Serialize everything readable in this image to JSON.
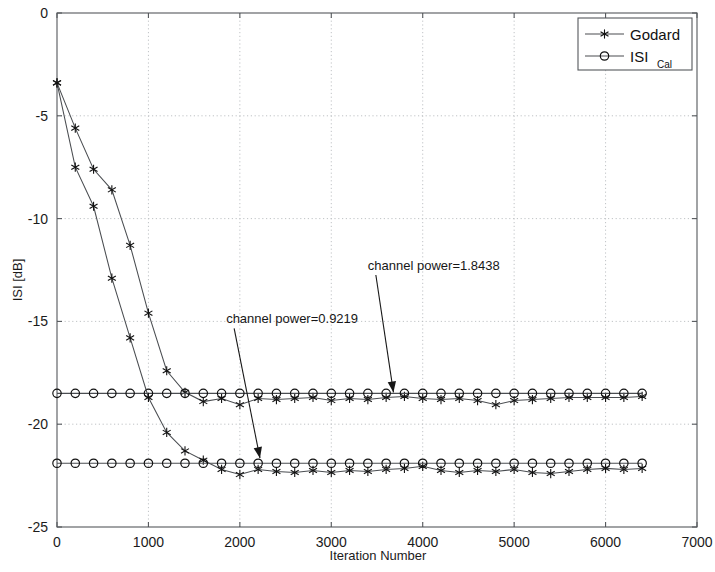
{
  "chart_data": {
    "type": "line",
    "title": "",
    "xlabel": "Iteration Number",
    "ylabel": "ISI [dB]",
    "xlim": [
      0,
      7000
    ],
    "ylim": [
      -25,
      0
    ],
    "xticks": [
      0,
      1000,
      2000,
      3000,
      4000,
      5000,
      6000,
      7000
    ],
    "yticks": [
      0,
      -5,
      -10,
      -15,
      -20,
      -25
    ],
    "xtick_labels": [
      "0",
      "1000",
      "2000",
      "3000",
      "4000",
      "5000",
      "6000",
      "7000"
    ],
    "ytick_labels": [
      "0",
      "-5",
      "-10",
      "-15",
      "-20",
      "-25"
    ],
    "grid": true,
    "legend_position": "top-right",
    "legend": [
      "Godard",
      "ISI Cal"
    ],
    "marker_interval": 200,
    "annotations": [
      {
        "text": "channel power=1.8438",
        "text_x": 3400,
        "text_y": -12.5,
        "target_x": 3680,
        "target_y": -18.6
      },
      {
        "text": "channel power=0.9219",
        "text_x": 1850,
        "text_y": -15.1,
        "target_x": 2220,
        "target_y": -21.8
      }
    ],
    "series": [
      {
        "name": "Godard-upper",
        "legend_ref": "Godard",
        "marker": "asterisk",
        "x": [
          0,
          200,
          400,
          600,
          800,
          1000,
          1200,
          1400,
          1600,
          1800,
          2000,
          2200,
          2400,
          2600,
          2800,
          3000,
          3200,
          3400,
          3600,
          3800,
          4000,
          4200,
          4400,
          4600,
          4800,
          5000,
          5200,
          5400,
          5600,
          5800,
          6000,
          6200,
          6400
        ],
        "y": [
          -3.4,
          -5.6,
          -7.6,
          -8.6,
          -11.3,
          -14.6,
          -17.4,
          -18.45,
          -18.9,
          -18.75,
          -19.05,
          -18.75,
          -18.8,
          -18.75,
          -18.7,
          -18.85,
          -18.75,
          -18.8,
          -18.7,
          -18.65,
          -18.75,
          -18.8,
          -18.75,
          -18.85,
          -19.05,
          -18.85,
          -18.8,
          -18.75,
          -18.7,
          -18.7,
          -18.7,
          -18.7,
          -18.65
        ]
      },
      {
        "name": "ISI-Cal-upper",
        "legend_ref": "ISI Cal",
        "marker": "circle",
        "x": [
          0,
          200,
          400,
          600,
          800,
          1000,
          1200,
          1400,
          1600,
          1800,
          2000,
          2200,
          2400,
          2600,
          2800,
          3000,
          3200,
          3400,
          3600,
          3800,
          4000,
          4200,
          4400,
          4600,
          4800,
          5000,
          5200,
          5400,
          5600,
          5800,
          6000,
          6200,
          6400
        ],
        "y": [
          -18.5,
          -18.5,
          -18.5,
          -18.5,
          -18.5,
          -18.5,
          -18.5,
          -18.5,
          -18.5,
          -18.5,
          -18.5,
          -18.5,
          -18.5,
          -18.5,
          -18.5,
          -18.5,
          -18.5,
          -18.5,
          -18.5,
          -18.5,
          -18.5,
          -18.5,
          -18.5,
          -18.5,
          -18.5,
          -18.5,
          -18.5,
          -18.5,
          -18.5,
          -18.5,
          -18.5,
          -18.5,
          -18.5
        ]
      },
      {
        "name": "Godard-lower",
        "legend_ref": "Godard",
        "marker": "asterisk",
        "x": [
          0,
          200,
          400,
          600,
          800,
          1000,
          1200,
          1400,
          1600,
          1800,
          2000,
          2200,
          2400,
          2600,
          2800,
          3000,
          3200,
          3400,
          3600,
          3800,
          4000,
          4200,
          4400,
          4600,
          4800,
          5000,
          5200,
          5400,
          5600,
          5800,
          6000,
          6200,
          6400
        ],
        "y": [
          -3.4,
          -7.5,
          -9.4,
          -12.9,
          -15.8,
          -18.7,
          -20.4,
          -21.3,
          -21.75,
          -22.2,
          -22.45,
          -22.2,
          -22.3,
          -22.35,
          -22.25,
          -22.35,
          -22.25,
          -22.3,
          -22.2,
          -22.15,
          -22.05,
          -22.25,
          -22.35,
          -22.25,
          -22.3,
          -22.2,
          -22.35,
          -22.4,
          -22.3,
          -22.2,
          -22.15,
          -22.2,
          -22.15
        ]
      },
      {
        "name": "ISI-Cal-lower",
        "legend_ref": "ISI Cal",
        "marker": "circle",
        "x": [
          0,
          200,
          400,
          600,
          800,
          1000,
          1200,
          1400,
          1600,
          1800,
          2000,
          2200,
          2400,
          2600,
          2800,
          3000,
          3200,
          3400,
          3600,
          3800,
          4000,
          4200,
          4400,
          4600,
          4800,
          5000,
          5200,
          5400,
          5600,
          5800,
          6000,
          6200,
          6400
        ],
        "y": [
          -21.9,
          -21.9,
          -21.9,
          -21.9,
          -21.9,
          -21.9,
          -21.9,
          -21.9,
          -21.9,
          -21.9,
          -21.9,
          -21.9,
          -21.9,
          -21.9,
          -21.9,
          -21.9,
          -21.9,
          -21.9,
          -21.9,
          -21.9,
          -21.9,
          -21.9,
          -21.9,
          -21.9,
          -21.9,
          -21.9,
          -21.9,
          -21.9,
          -21.9,
          -21.9,
          -21.9,
          -21.9,
          -21.9
        ]
      }
    ]
  },
  "legend": {
    "entries": [
      {
        "label": "Godard",
        "sub": "",
        "marker": "asterisk"
      },
      {
        "label": "ISI",
        "sub": "Cal",
        "marker": "circle"
      }
    ]
  },
  "colors": {
    "line": "#4a4d51",
    "marker": "#111111",
    "axis": "#55585c",
    "grid": "#b9bcc0",
    "text": "#1b1b1b",
    "background": "#ffffff"
  }
}
